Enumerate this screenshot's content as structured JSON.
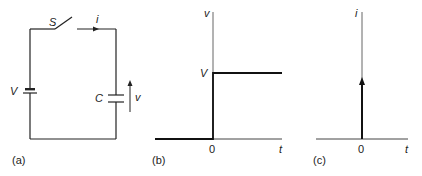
{
  "figure": {
    "panels": [
      {
        "id": "a",
        "label": "(a)",
        "type": "circuit",
        "components": {
          "switch": "S",
          "current": "i",
          "source": "V",
          "capacitor": "C",
          "capacitor_voltage": "v"
        }
      },
      {
        "id": "b",
        "label": "(b)",
        "type": "step-plot",
        "y_axis_label": "v",
        "x_axis_label": "t",
        "origin_label": "0",
        "level_label": "V"
      },
      {
        "id": "c",
        "label": "(c)",
        "type": "impulse-plot",
        "y_axis_label": "i",
        "x_axis_label": "t",
        "origin_label": "0"
      }
    ]
  },
  "colors": {
    "line": "#222222",
    "axis": "#555555",
    "background": "#ffffff"
  }
}
